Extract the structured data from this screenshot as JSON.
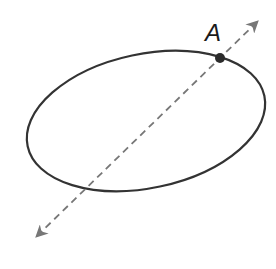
{
  "diagram": {
    "ellipse": {
      "cx": 146,
      "cy": 121,
      "rx": 121,
      "ry": 67,
      "rotation": -12,
      "stroke": "#333333",
      "stroke_width": 2.2
    },
    "line": {
      "x1": 37,
      "y1": 236,
      "x2": 257,
      "y2": 22,
      "stroke": "#777777",
      "dash": "7 5",
      "arrows": "both"
    },
    "point": {
      "label": "A",
      "x": 220,
      "y": 58,
      "color": "#2b2b2b",
      "label_x": 205,
      "label_y": 21
    }
  }
}
